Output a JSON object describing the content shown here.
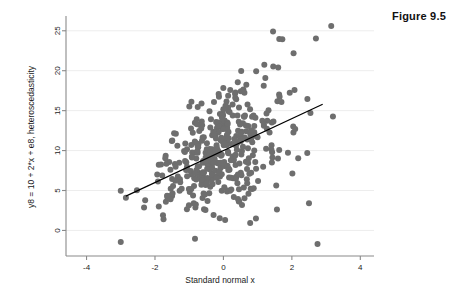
{
  "figure": {
    "caption": "Figure 9.5"
  },
  "chart_data": {
    "type": "scatter",
    "title": "",
    "xlabel": "Standard normal x",
    "ylabel": "y8 = 10 + 2*x + e8, heteroscedasticity",
    "xlim": [
      -4.6,
      4.4
    ],
    "ylim": [
      -3.2,
      26.6
    ],
    "xticks": [
      -4,
      -2,
      0,
      2,
      4
    ],
    "xticklabels": [
      "-4",
      "-2",
      "0",
      "2",
      "4"
    ],
    "yticks": [
      0,
      5,
      10,
      15,
      20,
      25
    ],
    "yticklabels": [
      "0",
      "5",
      "10",
      "15",
      "20",
      "25"
    ],
    "grid": "horizontal",
    "grid_color": "#ededed",
    "axis_color": "#8a8a8a",
    "marker": {
      "shape": "circle",
      "color": "#6e6e6e",
      "size": 3.0,
      "count": 400
    },
    "fit_line": {
      "name": "linear fit",
      "color": "#000000",
      "width": 1.2,
      "intercept": 10.0,
      "slope": 2.0,
      "x_start": -2.85,
      "x_end": 2.9
    },
    "model": {
      "description": "heteroscedastic errors, sd grows with x",
      "base_sd": 1.6,
      "sd_growth": 1.35,
      "n": 400,
      "seed": 20250119
    },
    "annotations": [],
    "legend": "none",
    "notable_points": [
      {
        "x": 3.15,
        "y": 25.6
      },
      {
        "x": 1.45,
        "y": 24.9
      },
      {
        "x": 2.05,
        "y": 22.2
      },
      {
        "x": 1.6,
        "y": 20.4
      },
      {
        "x": 2.75,
        "y": -1.7
      },
      {
        "x": 2.5,
        "y": 3.4
      },
      {
        "x": 2.45,
        "y": 9.7
      },
      {
        "x": -2.85,
        "y": 4.1
      },
      {
        "x": -1.75,
        "y": 1.4
      },
      {
        "x": 0.05,
        "y": 1.3
      },
      {
        "x": 0.95,
        "y": 1.5
      }
    ]
  }
}
